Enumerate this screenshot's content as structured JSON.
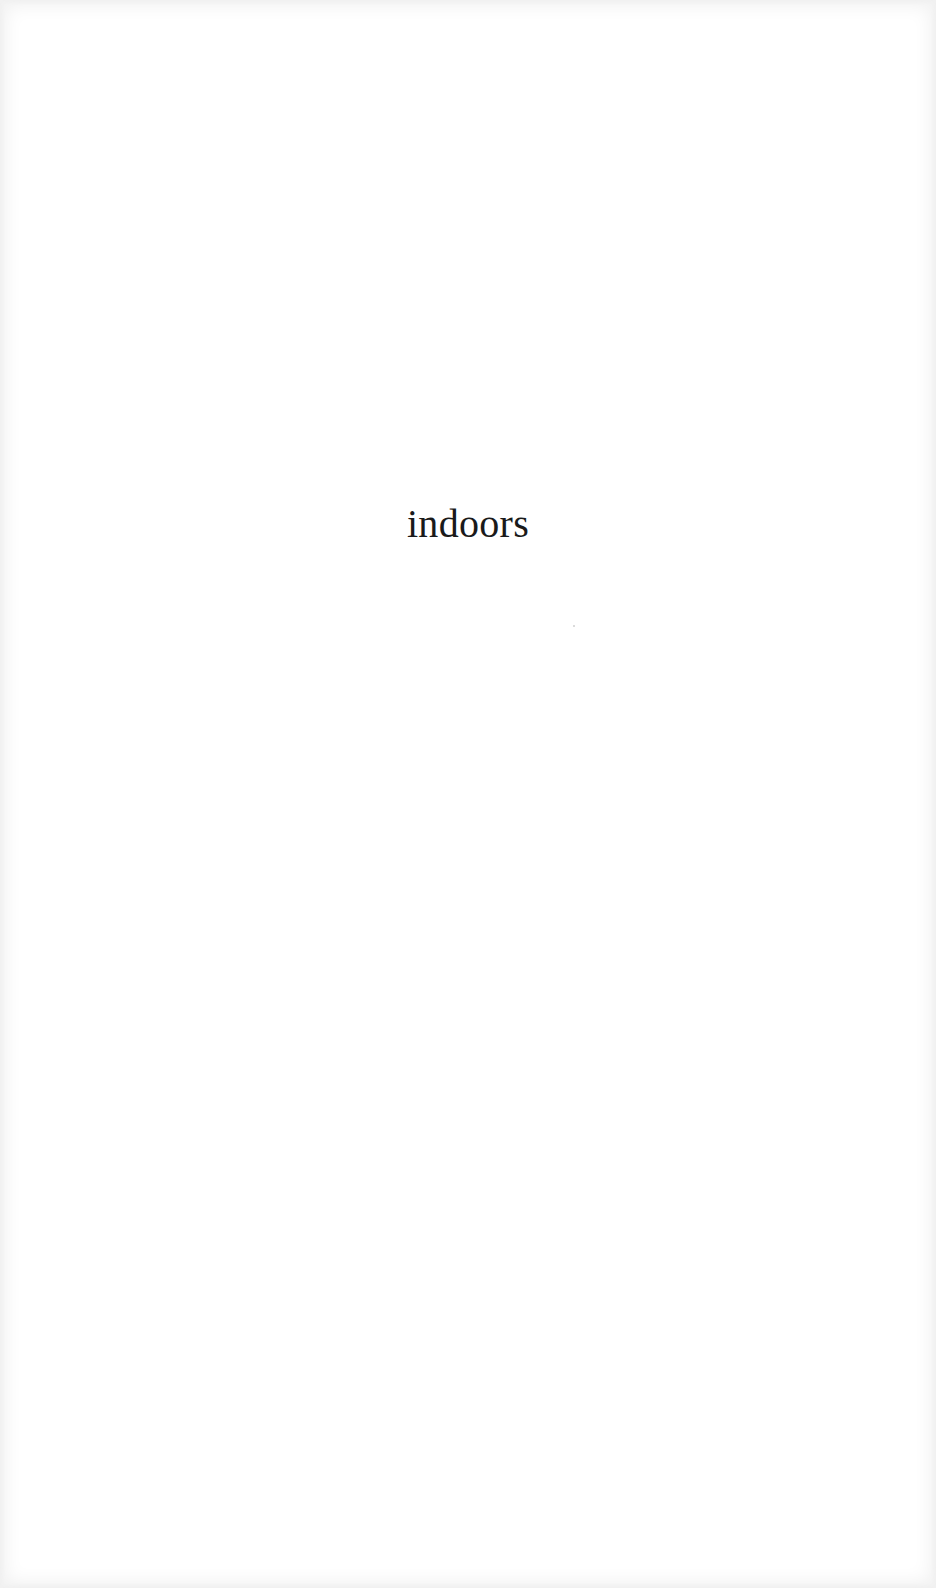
{
  "page": {
    "heading": "indoors"
  },
  "colors": {
    "background": "#ffffff",
    "text": "#1a1a1a"
  }
}
